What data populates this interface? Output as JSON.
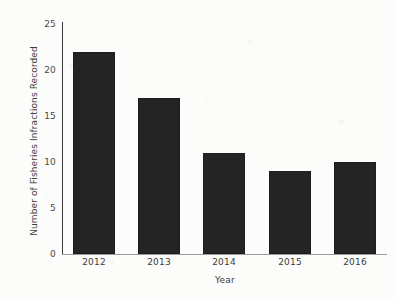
{
  "chart_data": {
    "type": "bar",
    "title": "",
    "categories": [
      "2012",
      "2013",
      "2014",
      "2015",
      "2016"
    ],
    "values": [
      22,
      17,
      11,
      9,
      10
    ],
    "series": [
      {
        "name": "Fisheries Infractions Recorded",
        "values": [
          22,
          17,
          11,
          9,
          10
        ]
      }
    ],
    "xlabel": "Year",
    "ylabel": "Number of Fisheries Infractions Recorded",
    "ylim": [
      0,
      25
    ],
    "yticks": [
      0,
      5,
      10,
      15,
      20,
      25
    ],
    "ytick_labels": [
      "0",
      "5",
      "10",
      "15",
      "20",
      "25"
    ],
    "xtick_labels": [
      "2012",
      "2013",
      "2014",
      "2015",
      "2016"
    ],
    "grid": false,
    "legend": null,
    "bar_color": "#242424",
    "background_color": "#fcfcfa",
    "axis_color": "#3a3a3a",
    "text_color": "#3d3d3d"
  }
}
